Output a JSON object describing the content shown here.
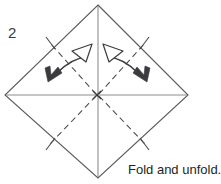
{
  "figure": {
    "step_number": "2",
    "caption": "Fold and unfold.",
    "title": "Origami diagram step 2 - square base diagonal fold",
    "colors": {
      "outline": "#5a5a60",
      "crease_solid": "#8d8d92",
      "crease_dashed": "#4a4a4e",
      "arrow": "#3b3b3f",
      "background": "#ffffff",
      "text": "#231f20",
      "step_text": "#3a3a3a"
    },
    "shape": {
      "name": "square-rotated-45",
      "vertices": {
        "top": [
          98,
          5
        ],
        "right": [
          188,
          95
        ],
        "bottom": [
          98,
          178
        ],
        "left": [
          5,
          95
        ]
      }
    },
    "creases": [
      {
        "name": "horizontal-valley-crease",
        "style": "solid",
        "from": [
          5,
          95
        ],
        "to": [
          188,
          95
        ]
      },
      {
        "name": "vertical-valley-crease",
        "style": "solid",
        "from": [
          98,
          5
        ],
        "to": [
          98,
          178
        ]
      },
      {
        "name": "diagonal-crease-upper-left",
        "style": "dashed",
        "from": [
          97,
          95
        ],
        "to": [
          51,
          44
        ]
      },
      {
        "name": "diagonal-crease-upper-right",
        "style": "dashed",
        "from": [
          97,
          95
        ],
        "to": [
          144,
          44
        ]
      },
      {
        "name": "diagonal-crease-lower-left",
        "style": "dashed",
        "from": [
          97,
          95
        ],
        "to": [
          51,
          143
        ]
      },
      {
        "name": "diagonal-crease-lower-right",
        "style": "dashed",
        "from": [
          97,
          95
        ],
        "to": [
          144,
          143
        ]
      }
    ],
    "tick_marks": [
      {
        "name": "tick-upper-left"
      },
      {
        "name": "tick-upper-right"
      },
      {
        "name": "tick-lower-left"
      },
      {
        "name": "tick-lower-right"
      }
    ],
    "arrows": [
      {
        "name": "fold-unfold-arrow-left",
        "type": "double-headed-curved",
        "head_filled": "down-left",
        "head_open": "up-right"
      },
      {
        "name": "fold-unfold-arrow-right",
        "type": "double-headed-curved",
        "head_filled": "down-right",
        "head_open": "up-left"
      }
    ],
    "center_point": {
      "name": "center-intersection",
      "at": [
        97,
        95
      ]
    }
  }
}
